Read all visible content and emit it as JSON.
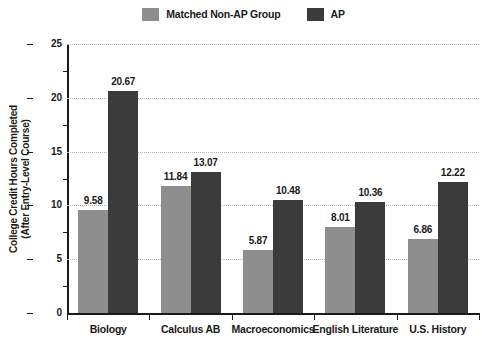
{
  "chart_data": {
    "type": "bar",
    "title": "",
    "subtitle": "",
    "xlabel": "",
    "ylabel": "College Credit Hours Completed (After Entry-Level Course)",
    "ylabel_lines": [
      "College Credit Hours Completed",
      "(After Entry-Level Course)"
    ],
    "categories": [
      "Biology",
      "Calculus AB",
      "Macroeconomics",
      "English Literature",
      "U.S. History"
    ],
    "series": [
      {
        "name": "Matched Non-AP Group",
        "color": "#8e8e8e",
        "values": [
          9.58,
          11.84,
          5.87,
          8.01,
          6.86
        ],
        "labels": [
          "9.58",
          "11.84",
          "5.87",
          "8.01",
          "6.86"
        ]
      },
      {
        "name": "AP",
        "color": "#3b3b3b",
        "values": [
          20.67,
          13.07,
          10.48,
          10.36,
          12.22
        ],
        "labels": [
          "20.67",
          "13.07",
          "10.48",
          "10.36",
          "12.22"
        ]
      }
    ],
    "ylim": [
      0,
      25
    ],
    "ytick_values": [
      0,
      5,
      10,
      15,
      20,
      25
    ],
    "ytick_labels": [
      "0",
      "5",
      "10",
      "15",
      "20",
      "25"
    ],
    "yminor_tick_values": [
      2.5,
      7.5,
      12.5,
      17.5,
      22.5
    ],
    "grid": true,
    "grid_axis": "y",
    "legend_position": "top-center",
    "data_labels": true
  },
  "legend": {
    "entries": [
      {
        "label": "Matched Non-AP Group",
        "color": "#8e8e8e"
      },
      {
        "label": "AP",
        "color": "#3b3b3b"
      }
    ]
  },
  "colors": {
    "background": "#ffffff",
    "axis": "#1a1a1a",
    "grid": "#b4b4b4",
    "series_non_ap": "#8e8e8e",
    "series_ap": "#3b3b3b",
    "text": "#1a1a1a"
  }
}
